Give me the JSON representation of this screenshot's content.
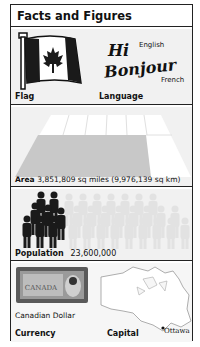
{
  "title": "Facts and Figures",
  "flag": {
    "label": "Flag",
    "country": "Canada",
    "icon": "maple-leaf-flag"
  },
  "language": {
    "label": "Language",
    "greetings": [
      {
        "word": "Hi",
        "language": "English"
      },
      {
        "word": "Bonjour",
        "language": "French"
      }
    ]
  },
  "area": {
    "label": "Area",
    "value": "3,851,809 sq miles (9,976,139 sq km)"
  },
  "population": {
    "label": "Population",
    "value": "23,600,000"
  },
  "currency": {
    "label": "Currency",
    "name": "Canadian Dollar",
    "banknote_text": "CANADA"
  },
  "capital": {
    "label": "Capital",
    "city": "Ottawa"
  },
  "colors": {
    "border": "#222222",
    "panel": "#f1f1f1",
    "shade": "#c8c8c8",
    "light_figure": "#e2e2e2",
    "dark_figure": "#1a1a1a"
  }
}
